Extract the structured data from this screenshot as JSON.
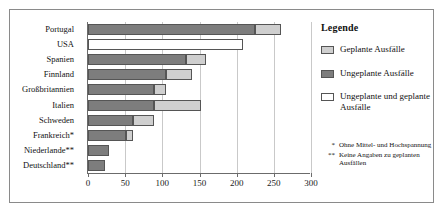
{
  "chart_data": {
    "type": "bar",
    "orientation": "horizontal",
    "title": "",
    "xlabel": "",
    "ylabel": "",
    "xlim": [
      0,
      300
    ],
    "xticks": [
      0,
      50,
      100,
      150,
      200,
      250,
      300
    ],
    "grid": true,
    "categories": [
      "Portugal",
      "USA",
      "Spanien",
      "Finnland",
      "Großbritannien",
      "Italien",
      "Schweden",
      "Frankreich*",
      "Niederlande**",
      "Deutschland**"
    ],
    "series": [
      {
        "name": "Ungeplante Ausfälle",
        "key": "unplanned",
        "color": "#7d7d7d",
        "values": [
          224,
          null,
          132,
          105,
          89,
          89,
          60,
          51,
          28,
          23
        ]
      },
      {
        "name": "Geplante Ausfälle",
        "key": "planned",
        "color": "#cfcfcf",
        "values": [
          36,
          null,
          27,
          35,
          16,
          63,
          29,
          9,
          null,
          null
        ]
      },
      {
        "name": "Ungeplante und geplante Ausfälle",
        "key": "both",
        "color": "#ffffff",
        "values": [
          null,
          209,
          null,
          null,
          null,
          null,
          null,
          null,
          null,
          null
        ]
      }
    ],
    "totals": [
      260,
      209,
      159,
      140,
      105,
      152,
      89,
      60,
      28,
      23
    ]
  },
  "legend": {
    "title": "Legende",
    "position": "right",
    "items": [
      {
        "label": "Geplante Ausfälle",
        "swatch": "planned"
      },
      {
        "label": "Ungeplante Ausfälle",
        "swatch": "unplanned"
      },
      {
        "label": "Ungeplante und geplante Ausfälle",
        "swatch": "both"
      }
    ]
  },
  "footnotes": [
    {
      "mark": "*",
      "text": "Ohne Mittel- und Hochspannung"
    },
    {
      "mark": "**",
      "text": "Keine Angaben zu geplanten Ausfällen"
    }
  ]
}
